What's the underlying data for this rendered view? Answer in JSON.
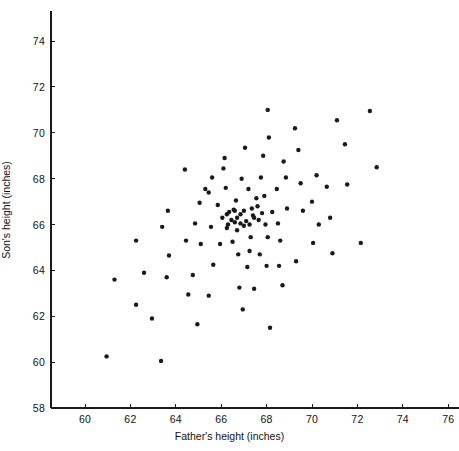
{
  "chart_data": {
    "type": "scatter",
    "title": "",
    "xlabel": "Father's height (inches)",
    "ylabel": "Son's height (inches)",
    "xlim": [
      58.5,
      76.5
    ],
    "ylim": [
      58,
      75.3
    ],
    "xticks": [
      60,
      62,
      64,
      66,
      68,
      70,
      72,
      74,
      76
    ],
    "yticks": [
      58,
      60,
      62,
      64,
      66,
      68,
      70,
      72,
      74
    ],
    "xticklabels": [
      "60",
      "62",
      "64",
      "66",
      "68",
      "70",
      "72",
      "74",
      "76"
    ],
    "yticklabels": [
      "58",
      "60",
      "62",
      "64",
      "66",
      "68",
      "70",
      "72",
      "74"
    ],
    "grid": false,
    "legend": null,
    "marker": {
      "shape": "circle",
      "color": "#1a1a1a",
      "size_px": 4.4
    },
    "axes": {
      "spine_left": true,
      "spine_bottom": true,
      "spine_top": false,
      "spine_right": false,
      "tick_direction": "out",
      "color": "#1a1a1a"
    },
    "n_points": 103,
    "points": [
      [
        60.95,
        60.25
      ],
      [
        61.3,
        63.6
      ],
      [
        62.25,
        65.3
      ],
      [
        62.25,
        62.5
      ],
      [
        62.6,
        63.9
      ],
      [
        62.95,
        61.9
      ],
      [
        63.35,
        60.05
      ],
      [
        63.4,
        65.9
      ],
      [
        63.6,
        63.7
      ],
      [
        63.65,
        66.6
      ],
      [
        63.7,
        64.65
      ],
      [
        64.4,
        68.4
      ],
      [
        64.45,
        65.3
      ],
      [
        64.55,
        62.95
      ],
      [
        64.75,
        63.8
      ],
      [
        64.85,
        66.05
      ],
      [
        64.95,
        61.65
      ],
      [
        65.05,
        66.95
      ],
      [
        65.1,
        65.15
      ],
      [
        65.45,
        67.4
      ],
      [
        65.45,
        62.9
      ],
      [
        65.55,
        65.9
      ],
      [
        65.6,
        68.05
      ],
      [
        65.65,
        64.25
      ],
      [
        65.85,
        66.85
      ],
      [
        65.95,
        65.15
      ],
      [
        66.05,
        66.3
      ],
      [
        66.1,
        68.45
      ],
      [
        66.15,
        68.9
      ],
      [
        66.2,
        67.6
      ],
      [
        66.25,
        65.85
      ],
      [
        66.3,
        66.0
      ],
      [
        66.35,
        66.55
      ],
      [
        66.45,
        66.2
      ],
      [
        66.5,
        65.25
      ],
      [
        66.55,
        66.65
      ],
      [
        66.6,
        66.6
      ],
      [
        66.6,
        66.1
      ],
      [
        66.65,
        67.05
      ],
      [
        66.7,
        66.3
      ],
      [
        66.7,
        65.75
      ],
      [
        66.75,
        64.7
      ],
      [
        66.8,
        63.25
      ],
      [
        66.85,
        66.05
      ],
      [
        66.85,
        66.45
      ],
      [
        66.9,
        68.0
      ],
      [
        66.95,
        62.3
      ],
      [
        67.0,
        65.95
      ],
      [
        67.0,
        66.6
      ],
      [
        67.05,
        69.35
      ],
      [
        67.1,
        66.15
      ],
      [
        67.15,
        64.15
      ],
      [
        67.2,
        67.55
      ],
      [
        67.25,
        64.85
      ],
      [
        67.25,
        66.0
      ],
      [
        67.3,
        65.45
      ],
      [
        67.35,
        66.7
      ],
      [
        67.4,
        66.4
      ],
      [
        67.45,
        63.2
      ],
      [
        67.55,
        67.15
      ],
      [
        67.6,
        66.8
      ],
      [
        67.65,
        66.2
      ],
      [
        67.7,
        64.7
      ],
      [
        67.75,
        68.05
      ],
      [
        67.8,
        66.5
      ],
      [
        67.85,
        69.0
      ],
      [
        67.9,
        67.25
      ],
      [
        67.95,
        66.0
      ],
      [
        68.0,
        64.2
      ],
      [
        68.05,
        71.0
      ],
      [
        68.05,
        65.45
      ],
      [
        68.1,
        69.8
      ],
      [
        68.15,
        61.5
      ],
      [
        68.45,
        67.55
      ],
      [
        68.5,
        66.05
      ],
      [
        68.55,
        64.2
      ],
      [
        68.6,
        65.3
      ],
      [
        68.7,
        63.35
      ],
      [
        68.75,
        68.75
      ],
      [
        68.85,
        68.05
      ],
      [
        68.9,
        66.7
      ],
      [
        69.25,
        70.2
      ],
      [
        69.3,
        64.4
      ],
      [
        69.4,
        69.25
      ],
      [
        69.5,
        67.8
      ],
      [
        70.0,
        67.0
      ],
      [
        70.05,
        65.2
      ],
      [
        70.2,
        68.15
      ],
      [
        70.3,
        66.0
      ],
      [
        70.65,
        67.65
      ],
      [
        70.8,
        66.3
      ],
      [
        70.9,
        64.75
      ],
      [
        71.1,
        70.55
      ],
      [
        71.45,
        69.5
      ],
      [
        71.55,
        67.75
      ],
      [
        72.15,
        65.2
      ],
      [
        72.55,
        70.95
      ],
      [
        72.85,
        68.5
      ],
      [
        65.3,
        67.55
      ],
      [
        66.25,
        66.45
      ],
      [
        67.45,
        66.3
      ],
      [
        68.25,
        66.55
      ],
      [
        69.6,
        66.6
      ]
    ]
  }
}
